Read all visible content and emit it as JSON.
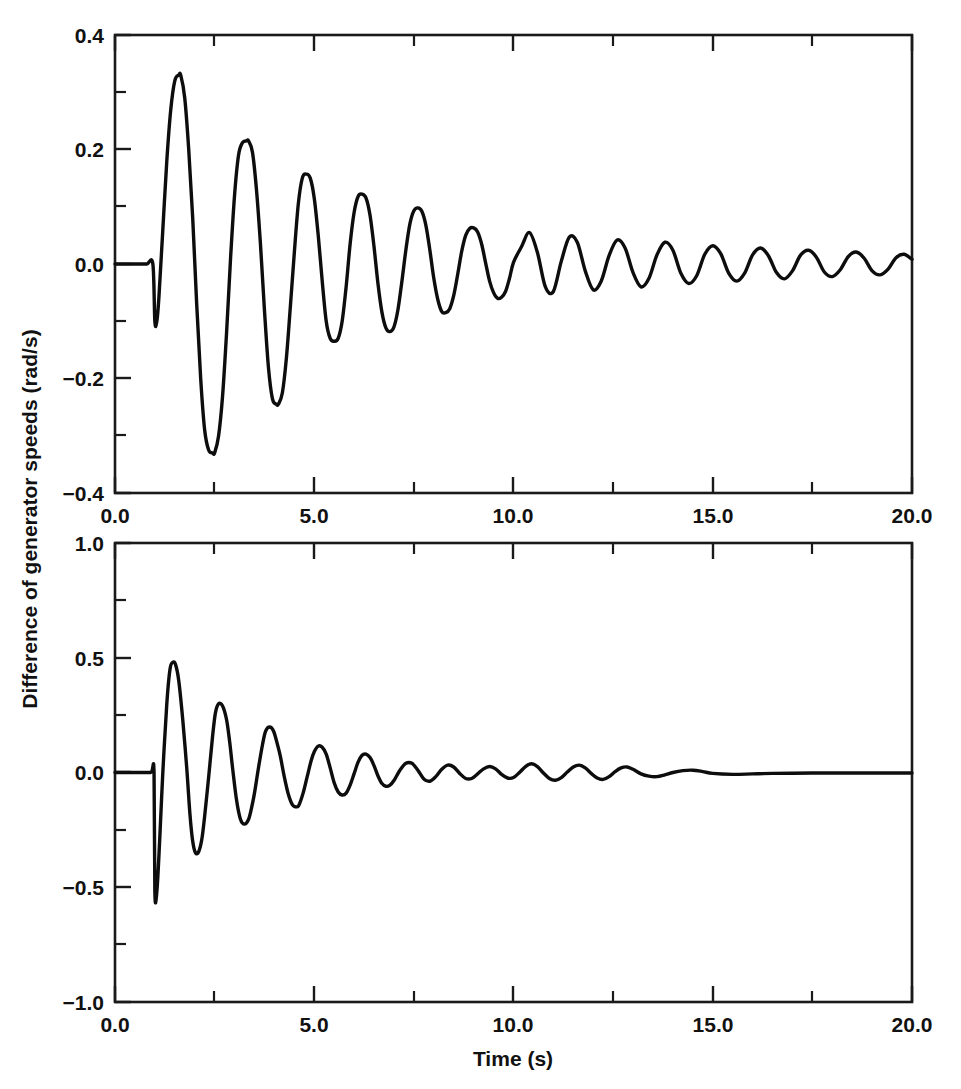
{
  "figure": {
    "background": "#ffffff",
    "ink_color": "#0d0d0d",
    "axis_color": "#1a1a1a",
    "width": 961,
    "height": 1089,
    "shared_ylabel": "Difference of generator speeds (rad/s)",
    "shared_xlabel": "Time (s)"
  },
  "chart_data": [
    {
      "type": "line",
      "panel": "top",
      "title": "",
      "xlabel": "",
      "ylabel": "Difference of generator speeds (rad/s)",
      "xlim": [
        0.0,
        20.0
      ],
      "ylim": [
        -0.4,
        0.4
      ],
      "xticks": [
        0.0,
        5.0,
        10.0,
        15.0,
        20.0
      ],
      "xtick_labels": [
        "0.0",
        "5.0",
        "10.0",
        "15.0",
        "20.0"
      ],
      "xminor_ticks": [
        2.5,
        7.5,
        12.5,
        17.5
      ],
      "yticks": [
        -0.4,
        -0.2,
        0.0,
        0.2,
        0.4
      ],
      "ytick_labels": [
        "−0.4",
        "−0.2",
        "0.0",
        "0.2",
        "0.4"
      ],
      "yminor_ticks": [
        -0.3,
        -0.1,
        0.1,
        0.3
      ],
      "grid": false,
      "legend": null,
      "series": [
        {
          "name": "lightly damped response",
          "color": "#0d0d0d",
          "description": "Pre-fault flat line at 0.0 rad/s until t=1.0 s, step down to -0.10, then a lightly damped oscillation of period about 0.80 s decaying slowly to near zero at t=20 s.",
          "x": [
            0.0,
            0.2,
            0.4,
            0.6,
            0.8,
            0.95,
            1.0,
            1.05,
            1.1,
            1.2,
            1.3,
            1.4,
            1.5,
            1.6,
            1.65,
            1.75,
            1.85,
            1.95,
            2.05,
            2.15,
            2.25,
            2.35,
            2.45,
            2.5,
            2.6,
            2.7,
            2.8,
            2.9,
            3.0,
            3.1,
            3.2,
            3.3,
            3.35,
            3.45,
            3.55,
            3.65,
            3.75,
            3.85,
            3.95,
            4.05,
            4.1,
            4.2,
            4.3,
            4.4,
            4.5,
            4.6,
            4.7,
            4.8,
            4.9,
            5.0,
            5.1,
            5.2,
            5.3,
            5.4,
            5.5,
            5.6,
            5.7,
            5.8,
            5.9,
            6.0,
            6.1,
            6.2,
            6.3,
            6.4,
            6.5,
            6.6,
            6.7,
            6.8,
            6.9,
            7.0,
            7.1,
            7.2,
            7.3,
            7.4,
            7.5,
            7.6,
            7.7,
            7.8,
            7.9,
            8.0,
            8.1,
            8.2,
            8.3,
            8.4,
            8.5,
            8.6,
            8.7,
            8.8,
            8.9,
            9.0,
            9.1,
            9.2,
            9.3,
            9.4,
            9.5,
            9.6,
            9.7,
            9.8,
            9.9,
            10.0,
            10.2,
            10.4,
            10.6,
            10.8,
            11.0,
            11.2,
            11.4,
            11.6,
            11.8,
            12.0,
            12.2,
            12.4,
            12.6,
            12.8,
            13.0,
            13.2,
            13.4,
            13.6,
            13.8,
            14.0,
            14.2,
            14.4,
            14.6,
            14.8,
            15.0,
            15.2,
            15.4,
            15.6,
            15.8,
            16.0,
            16.2,
            16.4,
            16.6,
            16.8,
            17.0,
            17.2,
            17.4,
            17.6,
            17.8,
            18.0,
            18.2,
            18.4,
            18.6,
            18.8,
            19.0,
            19.2,
            19.4,
            19.6,
            19.8,
            20.0
          ],
          "y": [
            0.0,
            0.0,
            0.0,
            0.0,
            0.0,
            0.0,
            -0.1,
            -0.1,
            -0.06,
            0.06,
            0.18,
            0.27,
            0.32,
            0.33,
            0.33,
            0.29,
            0.2,
            0.08,
            -0.07,
            -0.2,
            -0.29,
            -0.325,
            -0.33,
            -0.33,
            -0.3,
            -0.23,
            -0.12,
            0.01,
            0.12,
            0.19,
            0.212,
            0.215,
            0.215,
            0.195,
            0.13,
            0.035,
            -0.08,
            -0.18,
            -0.235,
            -0.245,
            -0.245,
            -0.225,
            -0.165,
            -0.075,
            0.02,
            0.105,
            0.15,
            0.157,
            0.15,
            0.115,
            0.05,
            -0.03,
            -0.1,
            -0.13,
            -0.135,
            -0.13,
            -0.1,
            -0.04,
            0.035,
            0.09,
            0.118,
            0.122,
            0.115,
            0.085,
            0.03,
            -0.035,
            -0.085,
            -0.112,
            -0.118,
            -0.11,
            -0.08,
            -0.03,
            0.025,
            0.07,
            0.093,
            0.098,
            0.092,
            0.068,
            0.025,
            -0.025,
            -0.062,
            -0.083,
            -0.085,
            -0.078,
            -0.055,
            -0.018,
            0.022,
            0.05,
            0.062,
            0.063,
            0.056,
            0.035,
            0.002,
            -0.03,
            -0.05,
            -0.06,
            -0.058,
            -0.048,
            -0.025,
            0.003,
            0.03,
            0.055,
            0.02,
            -0.04,
            -0.048,
            0.005,
            0.047,
            0.038,
            -0.012,
            -0.045,
            -0.03,
            0.015,
            0.042,
            0.028,
            -0.015,
            -0.04,
            -0.025,
            0.016,
            0.038,
            0.024,
            -0.016,
            -0.034,
            -0.02,
            0.017,
            0.032,
            0.018,
            -0.016,
            -0.03,
            -0.016,
            0.016,
            0.028,
            0.014,
            -0.015,
            -0.026,
            -0.012,
            0.015,
            0.024,
            0.012,
            -0.014,
            -0.022,
            -0.01,
            0.013,
            0.021,
            0.01,
            -0.012,
            -0.019,
            -0.009,
            0.011,
            0.017,
            0.008,
            -0.011,
            -0.015
          ]
        }
      ],
      "annotations": [
        {
          "text": "initial step at t = 1.0 s to -0.10 rad/s"
        },
        {
          "text": "first positive peak 0.33 rad/s near t = 1.65 s"
        },
        {
          "text": "first negative peak -0.33 rad/s near t = 2.50 s"
        }
      ]
    },
    {
      "type": "line",
      "panel": "bottom",
      "title": "",
      "xlabel": "Time (s)",
      "ylabel": "Difference of generator speeds (rad/s)",
      "xlim": [
        0.0,
        20.0
      ],
      "ylim": [
        -1.0,
        1.0
      ],
      "xticks": [
        0.0,
        5.0,
        10.0,
        15.0,
        20.0
      ],
      "xtick_labels": [
        "0.0",
        "5.0",
        "10.0",
        "15.0",
        "20.0"
      ],
      "xminor_ticks": [
        2.5,
        7.5,
        12.5,
        17.5
      ],
      "yticks": [
        -1.0,
        -0.5,
        0.0,
        0.5,
        1.0
      ],
      "ytick_labels": [
        "−1.0",
        "−0.5",
        "0.0",
        "0.5",
        "1.0"
      ],
      "yminor_ticks": [
        -0.75,
        -0.25,
        0.25,
        0.75
      ],
      "grid": false,
      "legend": null,
      "series": [
        {
          "name": "well damped response",
          "color": "#0d0d0d",
          "description": "Pre-fault flat line at 0.0 rad/s until t=1.0 s, sharp negative spike to -0.52, then a strongly damped oscillation of period about 0.85 s that is essentially settled by t=7 s, with a faint residual beat near t=10-12 s and a flat line after t=15 s.",
          "x": [
            0.0,
            0.3,
            0.6,
            0.9,
            0.98,
            1.0,
            1.05,
            1.12,
            1.2,
            1.3,
            1.38,
            1.45,
            1.52,
            1.6,
            1.7,
            1.8,
            1.88,
            1.95,
            2.02,
            2.1,
            2.18,
            2.25,
            2.35,
            2.45,
            2.52,
            2.6,
            2.7,
            2.8,
            2.88,
            2.95,
            3.05,
            3.15,
            3.25,
            3.35,
            3.42,
            3.5,
            3.6,
            3.7,
            3.78,
            3.88,
            3.98,
            4.08,
            4.15,
            4.25,
            4.35,
            4.45,
            4.55,
            4.62,
            4.72,
            4.82,
            4.92,
            5.0,
            5.1,
            5.2,
            5.3,
            5.4,
            5.5,
            5.6,
            5.7,
            5.8,
            5.9,
            6.0,
            6.1,
            6.2,
            6.3,
            6.4,
            6.5,
            6.6,
            6.7,
            6.8,
            6.9,
            7.0,
            7.15,
            7.3,
            7.45,
            7.6,
            7.75,
            7.9,
            8.05,
            8.2,
            8.35,
            8.5,
            8.65,
            8.8,
            8.95,
            9.1,
            9.25,
            9.4,
            9.55,
            9.7,
            9.85,
            10.0,
            10.15,
            10.3,
            10.45,
            10.6,
            10.75,
            10.9,
            11.05,
            11.2,
            11.35,
            11.5,
            11.65,
            11.8,
            11.95,
            12.1,
            12.25,
            12.4,
            12.55,
            12.7,
            12.85,
            13.0,
            13.2,
            13.4,
            13.6,
            13.8,
            14.0,
            14.25,
            14.5,
            14.75,
            15.0,
            15.5,
            16.0,
            16.5,
            17.0,
            17.5,
            18.0,
            18.5,
            19.0,
            19.5,
            20.0
          ],
          "y": [
            0.0,
            0.0,
            0.0,
            0.0,
            0.0,
            -0.52,
            -0.52,
            -0.3,
            0.0,
            0.3,
            0.45,
            0.48,
            0.47,
            0.4,
            0.23,
            0.02,
            -0.18,
            -0.3,
            -0.35,
            -0.345,
            -0.29,
            -0.19,
            -0.02,
            0.16,
            0.26,
            0.3,
            0.29,
            0.23,
            0.13,
            0.02,
            -0.12,
            -0.205,
            -0.225,
            -0.205,
            -0.16,
            -0.09,
            0.02,
            0.12,
            0.18,
            0.198,
            0.18,
            0.12,
            0.07,
            -0.02,
            -0.095,
            -0.14,
            -0.15,
            -0.14,
            -0.09,
            -0.02,
            0.05,
            0.09,
            0.115,
            0.11,
            0.08,
            0.02,
            -0.045,
            -0.085,
            -0.098,
            -0.09,
            -0.055,
            -0.005,
            0.045,
            0.075,
            0.08,
            0.065,
            0.03,
            -0.015,
            -0.048,
            -0.06,
            -0.055,
            -0.035,
            0.01,
            0.04,
            0.04,
            0.01,
            -0.028,
            -0.038,
            -0.018,
            0.014,
            0.032,
            0.024,
            -0.004,
            -0.026,
            -0.026,
            -0.006,
            0.016,
            0.026,
            0.016,
            -0.008,
            -0.024,
            -0.022,
            0.0,
            0.026,
            0.038,
            0.026,
            -0.002,
            -0.026,
            -0.034,
            -0.022,
            0.002,
            0.024,
            0.032,
            0.02,
            -0.004,
            -0.024,
            -0.03,
            -0.018,
            0.004,
            0.02,
            0.024,
            0.014,
            -0.006,
            -0.016,
            -0.018,
            -0.01,
            0.0,
            0.008,
            0.01,
            0.004,
            -0.004,
            -0.008,
            -0.006,
            -0.004,
            -0.003,
            -0.002,
            -0.002,
            -0.002,
            -0.002,
            -0.002,
            -0.002,
            -0.002
          ]
        }
      ],
      "annotations": [
        {
          "text": "negative spike to -0.52 rad/s at t = 1.0 s"
        },
        {
          "text": "first positive peak 0.48 rad/s near t = 1.45 s"
        },
        {
          "text": "oscillation essentially damped out by t = 7 s"
        }
      ]
    }
  ]
}
